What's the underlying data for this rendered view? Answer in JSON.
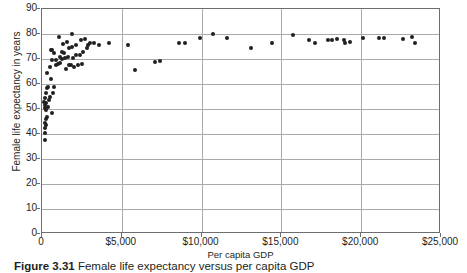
{
  "figure": {
    "caption_label": "Figure 3.31",
    "caption_text": "Female life expectancy versus per capita GDP"
  },
  "chart_data": {
    "type": "scatter",
    "title": "",
    "xlabel": "Per capita GDP",
    "ylabel": "Female life expectancy in years",
    "xlim": [
      0,
      25000
    ],
    "ylim": [
      0,
      90
    ],
    "grid": true,
    "legend": null,
    "xticks": [
      0,
      5000,
      10000,
      15000,
      20000,
      25000
    ],
    "xtick_labels": [
      "0",
      "$5,000",
      "$10,000",
      "$15,000",
      "$20,000",
      "$25,000"
    ],
    "yticks": [
      0,
      10,
      20,
      30,
      40,
      50,
      60,
      70,
      80,
      90
    ],
    "ytick_labels": [
      "0",
      "10",
      "20",
      "30",
      "40",
      "50",
      "60",
      "70",
      "80",
      "90"
    ],
    "series": [
      {
        "name": "countries",
        "marker": "circle",
        "color": "#231f20",
        "points": [
          [
            180,
            37.5
          ],
          [
            200,
            40.5
          ],
          [
            190,
            42.5
          ],
          [
            230,
            43.5
          ],
          [
            170,
            44.5
          ],
          [
            250,
            46.0
          ],
          [
            300,
            47.0
          ],
          [
            640,
            48.5
          ],
          [
            260,
            49.5
          ],
          [
            210,
            50.5
          ],
          [
            350,
            51.0
          ],
          [
            160,
            51.5
          ],
          [
            230,
            52.5
          ],
          [
            150,
            53.0
          ],
          [
            420,
            53.5
          ],
          [
            190,
            54.5
          ],
          [
            520,
            55.0
          ],
          [
            260,
            56.5
          ],
          [
            700,
            56.5
          ],
          [
            330,
            58.5
          ],
          [
            400,
            59.0
          ],
          [
            780,
            59.0
          ],
          [
            560,
            62.0
          ],
          [
            300,
            64.5
          ],
          [
            1520,
            66.0
          ],
          [
            470,
            67.0
          ],
          [
            900,
            67.5
          ],
          [
            1020,
            68.0
          ],
          [
            1150,
            68.3
          ],
          [
            1700,
            67.5
          ],
          [
            1800,
            67.5
          ],
          [
            2000,
            67.0
          ],
          [
            2250,
            67.5
          ],
          [
            2500,
            68.0
          ],
          [
            620,
            69.5
          ],
          [
            850,
            69.5
          ],
          [
            1280,
            70.0
          ],
          [
            1450,
            70.5
          ],
          [
            1600,
            70.8
          ],
          [
            1950,
            70.5
          ],
          [
            2150,
            71.5
          ],
          [
            1100,
            71.0
          ],
          [
            760,
            72.5
          ],
          [
            560,
            73.5
          ],
          [
            640,
            73.8
          ],
          [
            1250,
            73.0
          ],
          [
            1380,
            72.5
          ],
          [
            2350,
            71.8
          ],
          [
            2600,
            73.0
          ],
          [
            2800,
            74.5
          ],
          [
            3000,
            76.5
          ],
          [
            2900,
            75.5
          ],
          [
            3250,
            76.5
          ],
          [
            3600,
            75.5
          ],
          [
            1700,
            74.5
          ],
          [
            1900,
            75.0
          ],
          [
            2100,
            75.5
          ],
          [
            1300,
            76.0
          ],
          [
            1550,
            77.0
          ],
          [
            2450,
            77.5
          ],
          [
            2700,
            78.0
          ],
          [
            1050,
            79.0
          ],
          [
            1850,
            80.0
          ],
          [
            4200,
            76.5
          ],
          [
            5400,
            75.5
          ],
          [
            5800,
            65.5
          ],
          [
            7100,
            69.0
          ],
          [
            7400,
            69.2
          ],
          [
            8600,
            76.5
          ],
          [
            8950,
            76.5
          ],
          [
            9900,
            78.5
          ],
          [
            10700,
            80.0
          ],
          [
            11600,
            78.5
          ],
          [
            13100,
            74.5
          ],
          [
            14400,
            76.5
          ],
          [
            15700,
            79.5
          ],
          [
            16700,
            77.5
          ],
          [
            17100,
            76.5
          ],
          [
            17900,
            77.5
          ],
          [
            18200,
            77.8
          ],
          [
            18500,
            78.0
          ],
          [
            18900,
            77.8
          ],
          [
            19300,
            77.0
          ],
          [
            19000,
            76.5
          ],
          [
            20100,
            78.5
          ],
          [
            21100,
            78.5
          ],
          [
            21400,
            78.5
          ],
          [
            22600,
            78.0
          ],
          [
            23200,
            79.0
          ],
          [
            23400,
            76.5
          ]
        ]
      }
    ]
  }
}
